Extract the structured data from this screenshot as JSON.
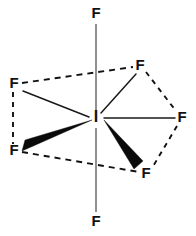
{
  "figure": {
    "kind": "molecular-structure-diagram",
    "molecule": "IF7",
    "geometry": "pentagonal bipyramidal",
    "background_color": "#ffffff",
    "ink_color": "#111111",
    "axial_bond_color": "#555555"
  },
  "atoms": {
    "center": {
      "label": "I",
      "name": "iodine-center",
      "x": 96,
      "y": 118
    },
    "axial": [
      {
        "label": "F",
        "name": "fluorine-axial-top",
        "x": 96,
        "y": 14
      },
      {
        "label": "F",
        "name": "fluorine-axial-bottom",
        "x": 96,
        "y": 222
      }
    ],
    "equatorial": [
      {
        "label": "F",
        "name": "fluorine-equatorial-upper-left",
        "x": 14,
        "y": 84
      },
      {
        "label": "F",
        "name": "fluorine-equatorial-upper-right",
        "x": 140,
        "y": 66
      },
      {
        "label": "F",
        "name": "fluorine-equatorial-right",
        "x": 182,
        "y": 118
      },
      {
        "label": "F",
        "name": "fluorine-equatorial-lower-right",
        "x": 146,
        "y": 174
      },
      {
        "label": "F",
        "name": "fluorine-equatorial-lower-left",
        "x": 14,
        "y": 151
      }
    ]
  },
  "bonds": {
    "axial": [
      {
        "name": "bond-axial-top",
        "x1": 96,
        "y1": 24,
        "x2": 96,
        "y2": 110
      },
      {
        "name": "bond-axial-bottom",
        "x1": 96,
        "y1": 128,
        "x2": 96,
        "y2": 212
      }
    ],
    "plain": [
      {
        "name": "bond-to-upper-left-fluorine",
        "x1": 89,
        "y1": 117,
        "x2": 23,
        "y2": 91
      },
      {
        "name": "bond-to-upper-right-fluorine",
        "x1": 101,
        "y1": 113,
        "x2": 136,
        "y2": 74
      },
      {
        "name": "bond-to-right-fluorine",
        "x1": 104,
        "y1": 118,
        "x2": 175,
        "y2": 118
      }
    ],
    "wedges": [
      {
        "name": "wedge-to-lower-left-fluorine",
        "apex_x": 92,
        "apex_y": 120,
        "base1_x": 25,
        "base1_y": 141,
        "base2_x": 22,
        "base2_y": 151
      },
      {
        "name": "wedge-to-lower-right-fluorine",
        "apex_x": 104,
        "apex_y": 121,
        "base1_x": 142,
        "base1_y": 161,
        "base2_x": 135,
        "base2_y": 169
      }
    ],
    "dashed": [
      {
        "name": "dashed-upper-left-to-upper-right",
        "x1": 22,
        "y1": 83,
        "x2": 133,
        "y2": 67
      },
      {
        "name": "dashed-upper-left-to-lower-left",
        "x1": 13,
        "y1": 92,
        "x2": 13,
        "y2": 144
      },
      {
        "name": "dashed-lower-left-to-lower-right",
        "x1": 22,
        "y1": 152,
        "x2": 139,
        "y2": 172
      },
      {
        "name": "dashed-upper-right-to-right",
        "x1": 146,
        "y1": 72,
        "x2": 176,
        "y2": 111
      },
      {
        "name": "dashed-right-to-lower-right",
        "x1": 177,
        "y1": 126,
        "x2": 152,
        "y2": 168
      }
    ]
  }
}
